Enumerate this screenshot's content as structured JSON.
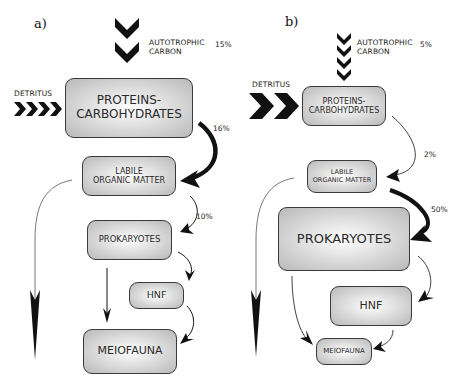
{
  "panels": [
    {
      "id": "a",
      "label": "a)",
      "autotrophic_label_line1": "AUTOTROPHIC",
      "autotrophic_label_line2": "CARBON",
      "autotrophic_pct": "15%",
      "detritus_label": "DETRITUS",
      "boxes": {
        "proteins_line1": "PROTEINS-",
        "proteins_line2": "CARBOHYDRATES",
        "labile_line1": "LABILE",
        "labile_line2": "ORGANIC MATTER",
        "prokaryotes": "PROKARYOTES",
        "hnf": "HNF",
        "meiofauna": "MEIOFAUNA"
      },
      "flows": {
        "proteins_to_labile": "16%",
        "labile_to_prokaryotes": "10%"
      }
    },
    {
      "id": "b",
      "label": "b)",
      "autotrophic_label_line1": "AUTOTROPHIC",
      "autotrophic_label_line2": "CARBON",
      "autotrophic_pct": "5%",
      "detritus_label": "DETRITUS",
      "boxes": {
        "proteins_line1": "PROTEINS-",
        "proteins_line2": "CARBOHYDRATES",
        "labile_line1": "LABILE",
        "labile_line2": "ORGANIC MATTER",
        "prokaryotes": "PROKARYOTES",
        "hnf": "HNF",
        "meiofauna": "MEIOFAUNA"
      },
      "flows": {
        "proteins_to_labile": "2%",
        "labile_to_prokaryotes": "50%"
      }
    }
  ],
  "colors": {
    "box_border": "#3a3a3a",
    "box_fill_center": "#ffffff",
    "box_fill_edge": "#b9b9b9",
    "arrow": "#111111"
  }
}
